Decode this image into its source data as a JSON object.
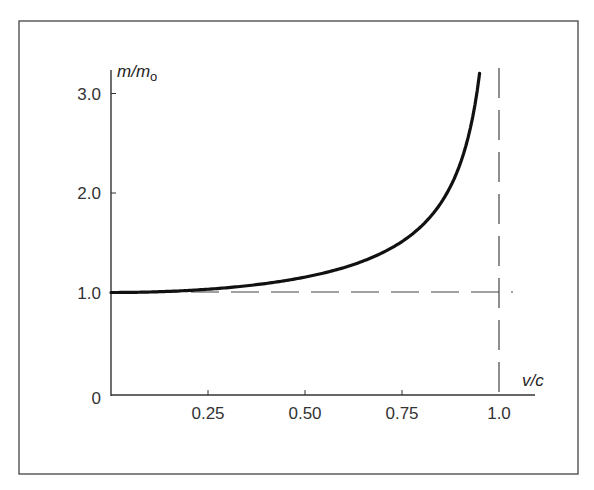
{
  "chart_data": {
    "type": "line",
    "title": "",
    "xlabel": "v/c",
    "ylabel": "m/m₀",
    "ylabel_main": "m/m",
    "ylabel_sub": "o",
    "xlim": [
      0,
      1.03
    ],
    "ylim": [
      0,
      3.3
    ],
    "x_ticks": [
      0.25,
      0.5,
      0.75,
      1.0
    ],
    "x_tick_labels": [
      "0.25",
      "0.50",
      "0.75",
      "1.0"
    ],
    "y_ticks": [
      0,
      1.0,
      2.0,
      3.0
    ],
    "y_tick_labels": [
      "0",
      "1.0",
      "2.0",
      "3.0"
    ],
    "grid": false,
    "legend": null,
    "series": [
      {
        "name": "m/m0 = 1/sqrt(1 - (v/c)^2)",
        "style": "solid",
        "x": [
          0,
          0.1,
          0.2,
          0.25,
          0.3,
          0.4,
          0.5,
          0.6,
          0.7,
          0.75,
          0.8,
          0.85,
          0.9,
          0.92,
          0.94,
          0.95
        ],
        "y": [
          1.0,
          1.005,
          1.021,
          1.033,
          1.048,
          1.091,
          1.155,
          1.25,
          1.4,
          1.512,
          1.667,
          1.898,
          2.294,
          2.552,
          2.931,
          3.203
        ]
      }
    ],
    "reference_lines": [
      {
        "name": "asymptote-v-equals-c",
        "orientation": "vertical",
        "value": 1.0,
        "style": "dashed"
      },
      {
        "name": "rest-mass-baseline",
        "orientation": "horizontal",
        "value": 1.0,
        "style": "dashed"
      }
    ]
  }
}
